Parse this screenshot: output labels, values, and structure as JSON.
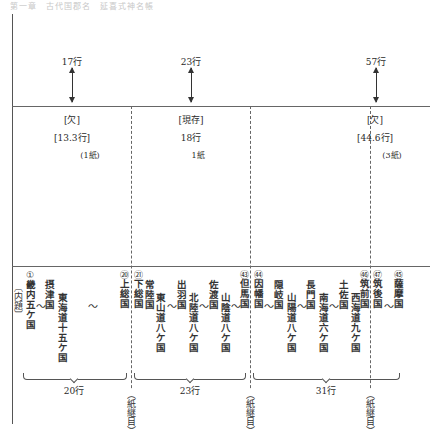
{
  "header": {
    "faded_text": "第一章　古代国郡名　延喜式神名帳"
  },
  "arrows": [
    {
      "label": "17行",
      "x": 72
    },
    {
      "label": "23行",
      "x": 191
    },
    {
      "label": "57行",
      "x": 376
    }
  ],
  "sections": [
    {
      "status": "[欠]",
      "rows": "[13.3行]",
      "sheets": "(1紙)"
    },
    {
      "status": "[現存]",
      "rows": "18行",
      "sheets": "1紙"
    },
    {
      "status": "[欠]",
      "rows": "[44.6行]",
      "sheets": "(3紙)"
    }
  ],
  "columns": [
    {
      "id": "naidai",
      "text": "〔内題〕"
    },
    {
      "id": "kinai",
      "circle": "①",
      "text": "畿内五ケ国"
    },
    {
      "id": "settsu",
      "text": "摂津国"
    },
    {
      "id": "tokaido",
      "text": "東海道十五ケ国"
    },
    {
      "id": "kazusa",
      "circle": "⑳",
      "text": "上総国"
    },
    {
      "id": "shimousa",
      "circle": "㉑",
      "text": "下総国"
    },
    {
      "id": "hitachi",
      "text": "常陸国"
    },
    {
      "id": "tosando",
      "text": "東山道八ケ国"
    },
    {
      "id": "dewa",
      "text": "出羽国"
    },
    {
      "id": "hokurikudo",
      "text": "北陸道八ケ国"
    },
    {
      "id": "sado",
      "text": "佐渡国"
    },
    {
      "id": "sanindo",
      "text": "山陰道八ケ国"
    },
    {
      "id": "tajima",
      "circle": "㊸",
      "text": "但馬国"
    },
    {
      "id": "inaba",
      "circle": "㊹",
      "text": "因幡国"
    },
    {
      "id": "oki",
      "text": "隠岐国"
    },
    {
      "id": "sanyodo",
      "text": "山陽道八ケ国"
    },
    {
      "id": "nagato",
      "text": "長門国"
    },
    {
      "id": "nankaido",
      "text": "南海道六ケ国"
    },
    {
      "id": "tosa",
      "text": "土佐国"
    },
    {
      "id": "saikaido",
      "text": "西海道九ケ国"
    },
    {
      "id": "chikuzen",
      "circle": "㊻",
      "text": "筑前国"
    },
    {
      "id": "chikugo",
      "circle": "㊼",
      "text": "筑後国"
    },
    {
      "id": "satsuma",
      "circle": "㊺",
      "text": "薩摩国"
    }
  ],
  "circle_numbers": {
    "kinai": "1",
    "kazusa": "20",
    "shimousa": "21",
    "tajima": "43",
    "inaba": "44",
    "chikuzen": "56",
    "chikugo": "57",
    "satsuma": "74"
  },
  "tilde": "～",
  "brackets": [
    {
      "label": "20行"
    },
    {
      "label": "23行"
    },
    {
      "label": "31行"
    }
  ],
  "seams": [
    {
      "label": "（紙継目）"
    },
    {
      "label": "（紙継目）"
    },
    {
      "label": "（紙継目）"
    }
  ]
}
